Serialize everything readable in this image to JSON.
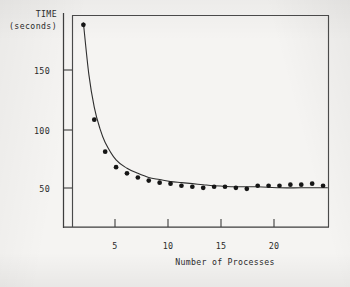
{
  "figure": {
    "background_color": "#f5f4f2",
    "ink_color": "#2b2b2b"
  },
  "chart_data": {
    "type": "scatter",
    "title": "",
    "subtitle": "",
    "xlabel": "Number of Processes",
    "ylabel": "TIME (seconds)",
    "ylabel_lines": [
      "TIME",
      "(seconds)"
    ],
    "xlim": [
      1,
      24.5
    ],
    "ylim": [
      0,
      205
    ],
    "xticks": [
      5,
      10,
      15,
      20
    ],
    "xtick_labels": [
      "5",
      "10",
      "15",
      "20"
    ],
    "yticks": [
      50,
      100,
      150
    ],
    "ytick_labels": [
      "50",
      "100",
      "150"
    ],
    "grid": false,
    "legend": false,
    "legend_position": "none",
    "tick_direction": "in",
    "frame": "full-box",
    "annotations": [],
    "series": [
      {
        "name": "measured time",
        "marker": "filled-circle",
        "marker_color": "#151515",
        "x": [
          2,
          3,
          4,
          5,
          6,
          7,
          8,
          9,
          10,
          11,
          12,
          13,
          14,
          15,
          16,
          17,
          18,
          19,
          20,
          21,
          22,
          23,
          24
        ],
        "y": [
          196,
          104,
          73,
          58,
          52,
          48,
          45,
          43,
          42,
          40,
          39,
          38,
          39,
          39,
          38,
          37,
          40,
          40,
          40,
          41,
          41,
          42,
          40
        ]
      },
      {
        "name": "fitted curve",
        "marker": "none",
        "line_color": "#2e2e2e",
        "x": [
          2,
          2.5,
          3,
          3.5,
          4,
          5,
          6,
          7,
          8,
          9,
          10,
          11,
          12,
          13,
          14,
          16,
          18,
          20,
          22,
          24.4
        ],
        "y": [
          198,
          148,
          116,
          96,
          82,
          65,
          57,
          52,
          48,
          46,
          44,
          43,
          42,
          41,
          40,
          39,
          39,
          38,
          38,
          38
        ]
      }
    ]
  }
}
